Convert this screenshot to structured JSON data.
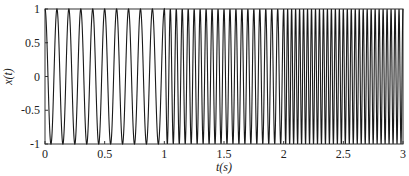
{
  "chart_data": {
    "type": "line",
    "title": "",
    "xlabel": "t(s)",
    "ylabel": "x(t)",
    "xlim": [
      0,
      3
    ],
    "ylim": [
      -1,
      1
    ],
    "grid": false,
    "legend": null,
    "x_ticks": [
      "0",
      "0.5",
      "1",
      "1.5",
      "2",
      "2.5",
      "3"
    ],
    "y_ticks": [
      "1",
      "0.5",
      "0",
      "-0.5",
      "-1"
    ],
    "x_tick_values": [
      0,
      0.5,
      1,
      1.5,
      2,
      2.5,
      3
    ],
    "y_tick_values": [
      1,
      0.5,
      0,
      -0.5,
      -1
    ],
    "series": [
      {
        "name": "x(t)",
        "description": "Piecewise cosine with frequency increasing stepwise",
        "segments": [
          {
            "t_start": 0,
            "t_end": 1,
            "frequency_hz": 10,
            "amplitude": 1
          },
          {
            "t_start": 1,
            "t_end": 2,
            "frequency_hz": 20,
            "amplitude": 1
          },
          {
            "t_start": 2,
            "t_end": 3,
            "frequency_hz": 30,
            "amplitude": 1
          }
        ],
        "color": "#1a1a1a"
      }
    ]
  },
  "plot": {
    "left": 45,
    "right": 403,
    "top": 9,
    "bottom": 144
  }
}
